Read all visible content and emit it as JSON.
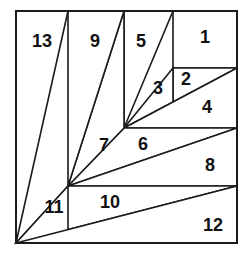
{
  "figure": {
    "canvas": {
      "width": 249,
      "height": 258
    },
    "square": {
      "left": 16,
      "top": 11,
      "right": 237,
      "bottom": 243
    },
    "colors": {
      "background": "#ffffff",
      "stroke": "#1b1b1b",
      "fill": "#ffffff",
      "label": "#111111"
    },
    "guides": {
      "vertical_lines": [
        {
          "name": "v-left",
          "x": 68,
          "y1": 11,
          "y2": 243
        },
        {
          "name": "v-mid",
          "x": 124,
          "y1": 11,
          "y2": 128
        },
        {
          "name": "v-right",
          "x": 173,
          "y1": 11,
          "y2": 68
        }
      ],
      "horizontal_lines": [
        {
          "name": "h-top",
          "y": 68,
          "x1": 173,
          "x2": 237
        },
        {
          "name": "h-mid",
          "y": 128,
          "x1": 124,
          "x2": 237
        },
        {
          "name": "h-low",
          "y": 186,
          "x1": 68,
          "x2": 237
        }
      ],
      "diagonal_lines": [
        {
          "name": "d-13",
          "x1": 16,
          "y1": 243,
          "x2": 68,
          "y2": 11
        },
        {
          "name": "d-9",
          "x1": 68,
          "y1": 186,
          "x2": 124,
          "y2": 11
        },
        {
          "name": "d-5",
          "x1": 124,
          "y1": 128,
          "x2": 173,
          "y2": 11
        },
        {
          "name": "d-3",
          "x1": 124,
          "y1": 128,
          "x2": 237,
          "y2": 68
        },
        {
          "name": "d-6",
          "x1": 68,
          "y1": 186,
          "x2": 237,
          "y2": 128
        },
        {
          "name": "d-10",
          "x1": 16,
          "y1": 243,
          "x2": 237,
          "y2": 186
        }
      ]
    },
    "regions": [
      {
        "id": 1,
        "label": "1",
        "shape": "rectangle",
        "points": "173,11 237,11 237,68 173,68",
        "label_x": 205,
        "label_y": 38
      },
      {
        "id": 2,
        "label": "2",
        "shape": "triangle",
        "points": "173,68 237,68 173,102",
        "label_x": 186,
        "label_y": 80
      },
      {
        "id": 3,
        "label": "3",
        "shape": "triangle",
        "points": "124,128 173,68 173,102",
        "label_x": 158,
        "label_y": 89
      },
      {
        "id": 4,
        "label": "4",
        "shape": "triangle",
        "points": "124,128 237,68 237,128",
        "label_x": 207,
        "label_y": 108
      },
      {
        "id": 5,
        "label": "5",
        "shape": "triangle",
        "points": "124,11 173,11 124,128",
        "label_x": 141,
        "label_y": 42
      },
      {
        "id": 6,
        "label": "6",
        "shape": "triangle",
        "points": "124,128 237,128 68,186",
        "label_x": 143,
        "label_y": 145
      },
      {
        "id": 7,
        "label": "7",
        "shape": "triangle",
        "points": "68,186 124,128 124,11",
        "label_x": 104,
        "label_y": 146
      },
      {
        "id": 8,
        "label": "8",
        "shape": "triangle",
        "points": "68,186 237,128 237,186",
        "label_x": 210,
        "label_y": 166
      },
      {
        "id": 9,
        "label": "9",
        "shape": "triangle",
        "points": "68,11 124,11 68,186",
        "label_x": 95,
        "label_y": 42
      },
      {
        "id": 10,
        "label": "10",
        "shape": "triangle",
        "points": "68,186 237,186 16,243",
        "label_x": 110,
        "label_y": 203
      },
      {
        "id": 11,
        "label": "11",
        "shape": "triangle",
        "points": "16,243 68,186 68,243",
        "label_x": 54,
        "label_y": 208
      },
      {
        "id": 12,
        "label": "12",
        "shape": "triangle",
        "points": "16,243 237,186 237,243",
        "label_x": 213,
        "label_y": 226
      },
      {
        "id": 13,
        "label": "13",
        "shape": "triangle",
        "points": "16,11 68,11 16,243",
        "label_x": 42,
        "label_y": 42
      }
    ]
  }
}
